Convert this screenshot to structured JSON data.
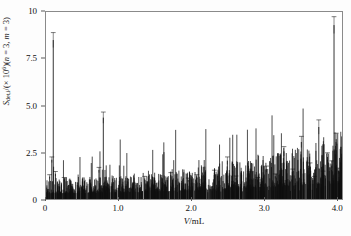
{
  "figure": {
    "background_color": "#ffffff",
    "frame_color": "#8a8a8a",
    "series_color": "#101010"
  },
  "axis": {
    "x_title_html": "V/mL",
    "x_title_plain": "V/mL",
    "y_title_plain": "S_det,i/(x 10^6)(n = 3, m = 3)",
    "y_symbol": "S",
    "y_subscript": "det,i",
    "y_divider": "/(× 10",
    "y_exponent": "6",
    "y_tail": ")(",
    "y_n_label": "n",
    "y_n_value": " = 3, ",
    "y_m_label": "m",
    "y_m_value": " = 3)",
    "x_ticks": [
      "0",
      "1.0",
      "2.0",
      "3.0",
      "4.0"
    ],
    "x_tick_values": [
      0,
      1.0,
      2.0,
      3.0,
      4.0
    ],
    "y_ticks": [
      "0",
      "2.5",
      "5.0",
      "7.5",
      "10"
    ],
    "y_tick_values": [
      0,
      2.5,
      5.0,
      7.5,
      10
    ],
    "xlim": [
      0,
      4.08
    ],
    "ylim": [
      0,
      10
    ],
    "grid": false,
    "legend": "none"
  },
  "chart_data": {
    "type": "bar",
    "title": "",
    "subtitle": "",
    "xlabel": "V/mL",
    "ylabel": "S_det,i/(×10^6) (n = 3, m = 3)",
    "xlim": [
      0,
      4.08
    ],
    "ylim": [
      0,
      10
    ],
    "grid": false,
    "legend_position": "none",
    "series_name": "S_det,i",
    "x": [
      0.02,
      0.05,
      0.08,
      0.1,
      0.13,
      0.16,
      0.19,
      0.22,
      0.25,
      0.28,
      0.31,
      0.34,
      0.37,
      0.4,
      0.43,
      0.46,
      0.49,
      0.52,
      0.55,
      0.58,
      0.61,
      0.64,
      0.67,
      0.7,
      0.73,
      0.76,
      0.79,
      0.82,
      0.85,
      0.88,
      0.91,
      0.94,
      0.97,
      1.0,
      1.03,
      1.06,
      1.09,
      1.12,
      1.15,
      1.18,
      1.21,
      1.24,
      1.27,
      1.3,
      1.33,
      1.36,
      1.39,
      1.42,
      1.45,
      1.48,
      1.51,
      1.54,
      1.57,
      1.6,
      1.63,
      1.66,
      1.69,
      1.72,
      1.75,
      1.78,
      1.81,
      1.84,
      1.87,
      1.9,
      1.93,
      1.96,
      1.99,
      2.02,
      2.05,
      2.08,
      2.11,
      2.14,
      2.17,
      2.2,
      2.23,
      2.26,
      2.29,
      2.32,
      2.35,
      2.38,
      2.41,
      2.44,
      2.47,
      2.5,
      2.53,
      2.56,
      2.59,
      2.62,
      2.65,
      2.68,
      2.71,
      2.74,
      2.77,
      2.8,
      2.83,
      2.86,
      2.89,
      2.92,
      2.95,
      2.98,
      3.01,
      3.04,
      3.07,
      3.1,
      3.13,
      3.16,
      3.19,
      3.22,
      3.25,
      3.28,
      3.31,
      3.34,
      3.37,
      3.4,
      3.43,
      3.46,
      3.49,
      3.52,
      3.55,
      3.58,
      3.61,
      3.64,
      3.67,
      3.7,
      3.73,
      3.76,
      3.79,
      3.82,
      3.85,
      3.88,
      3.91,
      3.94,
      3.97,
      4.0,
      4.03
    ],
    "values": [
      0.45,
      1.2,
      2.1,
      8.5,
      1.35,
      0.6,
      0.95,
      0.5,
      1.05,
      0.4,
      0.75,
      0.38,
      0.55,
      0.42,
      0.9,
      0.36,
      0.62,
      0.34,
      0.48,
      0.33,
      0.7,
      0.35,
      0.52,
      0.44,
      1.55,
      0.4,
      4.35,
      0.46,
      0.58,
      0.36,
      0.82,
      0.34,
      0.5,
      0.6,
      0.41,
      0.72,
      0.39,
      0.95,
      0.37,
      0.55,
      0.48,
      0.86,
      0.35,
      0.64,
      0.42,
      1.1,
      0.38,
      0.57,
      0.46,
      0.78,
      0.36,
      0.52,
      0.44,
      0.92,
      0.4,
      0.66,
      0.38,
      1.28,
      0.43,
      0.6,
      0.37,
      0.84,
      0.41,
      0.54,
      0.47,
      1.02,
      0.39,
      0.68,
      0.45,
      1.18,
      0.38,
      0.58,
      0.5,
      0.88,
      0.36,
      0.73,
      0.42,
      1.4,
      0.44,
      0.62,
      0.4,
      0.96,
      0.47,
      2.05,
      0.43,
      0.7,
      0.38,
      1.12,
      0.46,
      0.59,
      0.41,
      0.9,
      0.37,
      1.32,
      0.49,
      0.66,
      0.42,
      1.05,
      0.44,
      0.75,
      0.4,
      1.6,
      0.48,
      0.63,
      0.45,
      1.22,
      0.39,
      0.86,
      0.51,
      2.55,
      0.47,
      0.7,
      0.43,
      1.45,
      0.52,
      0.94,
      0.46,
      3.05,
      0.5,
      0.8,
      0.55,
      1.75,
      0.49,
      1.1,
      0.58,
      3.85,
      0.62,
      1.35,
      0.7,
      2.25,
      0.95,
      1.85,
      9.3,
      3.2,
      1.5
    ],
    "errors": [
      0.05,
      0.1,
      0.15,
      0.4,
      0.12,
      0.06,
      0.09,
      0.05,
      0.1,
      0.04,
      0.07,
      0.04,
      0.06,
      0.04,
      0.09,
      0.04,
      0.06,
      0.03,
      0.05,
      0.03,
      0.07,
      0.04,
      0.05,
      0.04,
      0.14,
      0.04,
      0.3,
      0.05,
      0.06,
      0.04,
      0.08,
      0.03,
      0.05,
      0.06,
      0.04,
      0.07,
      0.04,
      0.09,
      0.04,
      0.06,
      0.05,
      0.08,
      0.04,
      0.06,
      0.04,
      0.11,
      0.04,
      0.06,
      0.05,
      0.08,
      0.04,
      0.05,
      0.04,
      0.09,
      0.04,
      0.07,
      0.04,
      0.13,
      0.04,
      0.06,
      0.04,
      0.08,
      0.04,
      0.05,
      0.05,
      0.1,
      0.04,
      0.07,
      0.05,
      0.12,
      0.04,
      0.06,
      0.05,
      0.09,
      0.04,
      0.07,
      0.04,
      0.14,
      0.04,
      0.06,
      0.04,
      0.1,
      0.05,
      0.2,
      0.04,
      0.07,
      0.04,
      0.11,
      0.05,
      0.06,
      0.04,
      0.09,
      0.04,
      0.13,
      0.05,
      0.07,
      0.04,
      0.1,
      0.04,
      0.08,
      0.04,
      0.16,
      0.05,
      0.06,
      0.05,
      0.12,
      0.04,
      0.09,
      0.05,
      0.25,
      0.05,
      0.07,
      0.04,
      0.15,
      0.05,
      0.09,
      0.05,
      0.3,
      0.05,
      0.08,
      0.06,
      0.18,
      0.05,
      0.11,
      0.06,
      0.38,
      0.06,
      0.14,
      0.07,
      0.22,
      0.1,
      0.19,
      0.45,
      0.32,
      0.15
    ]
  }
}
